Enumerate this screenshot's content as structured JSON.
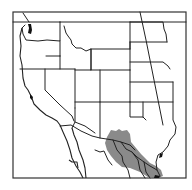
{
  "map": {
    "title": "Range map — western United States and northern Mexico",
    "region": "Western North America",
    "colors": {
      "background": "#ffffff",
      "borders": "#222222",
      "frame": "#333333",
      "range_fill": "#8a8a8a"
    },
    "layers": [
      {
        "name": "state-borders",
        "style": "black outline"
      },
      {
        "name": "species-range",
        "style": "gray shaded area",
        "location": "southern Arizona, southwestern New Mexico, western Texas, northern Mexico (Sonora, Chihuahua, Coahuila, Nuevo León, Tamaulipas)"
      }
    ]
  }
}
